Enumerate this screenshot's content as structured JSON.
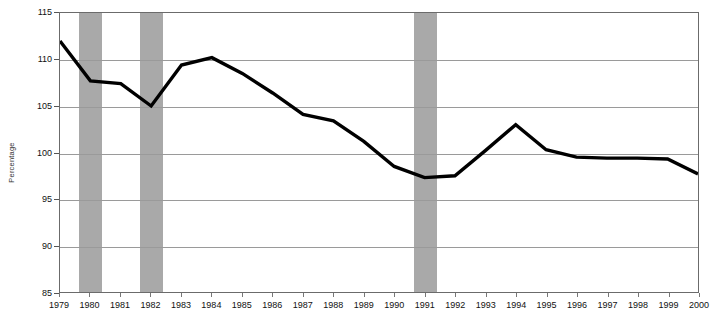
{
  "chart_data": {
    "type": "line",
    "title": "",
    "xlabel": "",
    "ylabel": "Percentage",
    "ylim": [
      85,
      115
    ],
    "ytick_step": 5,
    "yticks": [
      115,
      110,
      105,
      100,
      95,
      90,
      85
    ],
    "grid": true,
    "legend": "none",
    "line_color": "#000000",
    "line_width_px": 3.4,
    "band_color": "#a9a9a9",
    "gridline_color": "#9a9a9a",
    "axis_color": "#6b6b6b",
    "categories": [
      "1979",
      "1980",
      "1981",
      "1982",
      "1983",
      "1984",
      "1985",
      "1986",
      "1987",
      "1988",
      "1989",
      "1990",
      "1991",
      "1992",
      "1993",
      "1994",
      "1995",
      "1996",
      "1997",
      "1998",
      "1999",
      "2000"
    ],
    "x": [
      1979,
      1980,
      1981,
      1982,
      1983,
      1984,
      1985,
      1986,
      1987,
      1988,
      1989,
      1990,
      1991,
      1992,
      1993,
      1994,
      1995,
      1996,
      1997,
      1998,
      1999,
      2000
    ],
    "values": [
      112.0,
      107.7,
      107.4,
      105.0,
      109.4,
      110.2,
      108.5,
      106.4,
      104.1,
      103.4,
      101.2,
      98.5,
      97.3,
      97.5,
      100.2,
      103.0,
      100.3,
      99.5,
      99.4,
      99.4,
      99.3,
      97.7
    ],
    "series": [
      {
        "name": "Percentage",
        "values": [
          112.0,
          107.7,
          107.4,
          105.0,
          109.4,
          110.2,
          108.5,
          106.4,
          104.1,
          103.4,
          101.2,
          98.5,
          97.3,
          97.5,
          100.2,
          103.0,
          100.3,
          99.5,
          99.4,
          99.4,
          99.3,
          97.7
        ]
      }
    ],
    "shaded_bands": [
      {
        "label": "1980",
        "center": 1980,
        "start": 1979.62,
        "end": 1980.38
      },
      {
        "label": "1982",
        "center": 1982,
        "start": 1981.62,
        "end": 1982.38
      },
      {
        "label": "1991",
        "center": 1991,
        "start": 1990.62,
        "end": 1991.38
      }
    ],
    "annotations": []
  }
}
